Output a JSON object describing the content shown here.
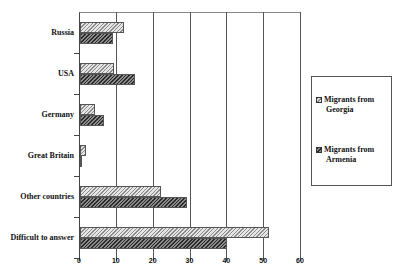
{
  "chart_data": {
    "type": "bar",
    "orientation": "horizontal",
    "title": "",
    "xlabel": "",
    "ylabel": "",
    "categories": [
      "Russia",
      "USA",
      "Germany",
      "Great Britain",
      "Other countries",
      "Difficult to answer"
    ],
    "series": [
      {
        "name": "Migrants from Georgia",
        "values": [
          12,
          9.3,
          4,
          1.5,
          22,
          51.3
        ],
        "pattern": "light-diagonal-hatch",
        "color": "#c8c8c8"
      },
      {
        "name": "Migrants from Armenia",
        "values": [
          9,
          15,
          6.5,
          0.5,
          29,
          40
        ],
        "pattern": "dark-diagonal-hatch",
        "color": "#5a5a5a"
      }
    ],
    "xlim": [
      0,
      60
    ],
    "xticks": [
      "0",
      "10",
      "20",
      "30",
      "40",
      "50",
      "60"
    ],
    "grid": {
      "vertical": true,
      "horizontal": false
    },
    "legend_position": "right"
  },
  "legend": {
    "items": [
      {
        "line1": "Migrants from",
        "line2": "Georgia"
      },
      {
        "line1": "Migrants from",
        "line2": "Armenia"
      }
    ]
  }
}
